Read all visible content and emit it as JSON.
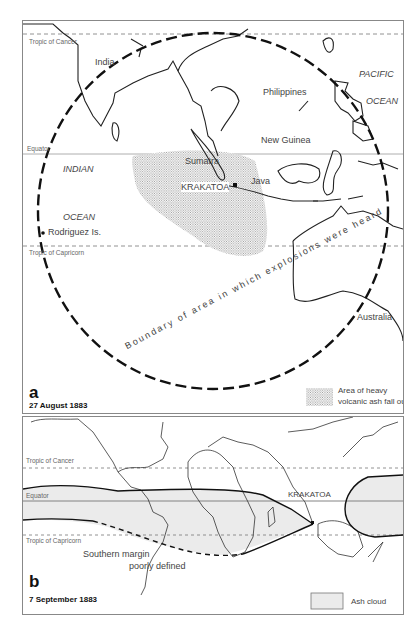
{
  "panel_a": {
    "letter": "a",
    "date": "27 August 1883",
    "latitude_lines": {
      "tropic_cancer": "Tropic of Cancer",
      "equator": "Equator",
      "tropic_capricorn": "Tropic of Capricorn"
    },
    "place_labels": {
      "india": "India",
      "philippines": "Philippines",
      "pacific": "PACIFIC",
      "ocean_pacific": "OCEAN",
      "new_guinea": "New Guinea",
      "indian": "INDIAN",
      "ocean_indian": "OCEAN",
      "sumatra": "Sumatra",
      "java": "Java",
      "krakatoa": "KRAKATOA",
      "rodriguez": "Rodriguez Is.",
      "australia": "Australia"
    },
    "boundary_label": "Boundary of area in which explosions were heard",
    "legend": {
      "line1": "Area of heavy",
      "line2": "volcanic ash fall out"
    }
  },
  "panel_b": {
    "letter": "b",
    "date": "7 September 1883",
    "latitude_lines": {
      "tropic_cancer": "Tropic of Cancer",
      "equator": "Equator",
      "tropic_capricorn": "Tropic of Capricorn"
    },
    "krakatoa": "KRAKATOA",
    "southern_margin": {
      "line1": "Southern margin",
      "line2": "poorly defined"
    },
    "legend": "Ash cloud"
  },
  "colors": {
    "ash_fill": "#ebebeb",
    "stipple": "#9a9a9a",
    "line": "#222222",
    "border": "#888888"
  }
}
